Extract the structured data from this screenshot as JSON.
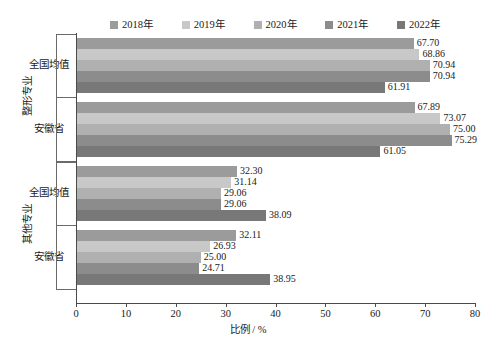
{
  "chart_data": {
    "type": "bar",
    "orientation": "horizontal",
    "title": "",
    "xlabel": "比例 / %",
    "ylabel": "",
    "xlim": [
      0,
      80
    ],
    "xticks": [
      0,
      10,
      20,
      30,
      40,
      50,
      60,
      70,
      80
    ],
    "grid": false,
    "legend_position": "top",
    "series": [
      {
        "name": "2018年",
        "color": "#9b9b9b",
        "values": [
          67.7,
          67.89,
          32.3,
          32.11
        ]
      },
      {
        "name": "2019年",
        "color": "#c8c8c8",
        "values": [
          68.86,
          73.07,
          31.14,
          26.93
        ]
      },
      {
        "name": "2020年",
        "color": "#b0b0b0",
        "values": [
          70.94,
          75.0,
          29.06,
          25.0
        ]
      },
      {
        "name": "2021年",
        "color": "#8c8c8c",
        "values": [
          70.94,
          75.29,
          29.06,
          24.71
        ]
      },
      {
        "name": "2022年",
        "color": "#787878",
        "values": [
          61.91,
          61.05,
          38.09,
          38.95
        ]
      }
    ],
    "categories": [
      "全国均值",
      "安徽省",
      "全国均值",
      "安徽省"
    ],
    "category_groups": [
      {
        "label": "整形专业",
        "categories": [
          "全国均值",
          "安徽省"
        ]
      },
      {
        "label": "其他专业",
        "categories": [
          "全国均值",
          "安徽省"
        ]
      }
    ],
    "value_labels": [
      [
        "67.70",
        "68.86",
        "70.94",
        "70.94",
        "61.91"
      ],
      [
        "67.89",
        "73.07",
        "75.00",
        "75.29",
        "61.05"
      ],
      [
        "32.30",
        "31.14",
        "29.06",
        "29.06",
        "38.09"
      ],
      [
        "32.11",
        "26.93",
        "25.00",
        "24.71",
        "38.95"
      ]
    ],
    "xtick_labels": [
      "0",
      "10",
      "20",
      "30",
      "40",
      "50",
      "60",
      "70",
      "80"
    ]
  }
}
